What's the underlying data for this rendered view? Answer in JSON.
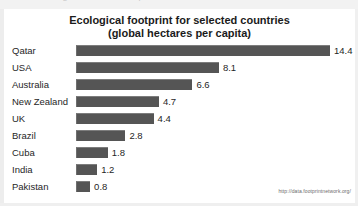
{
  "scan": {
    "top_ghost_text": "Ecological footprint"
  },
  "chart_data": {
    "type": "bar",
    "orientation": "horizontal",
    "title": "Ecological footprint for selected countries",
    "subtitle": "(global hectares per capita)",
    "xlabel": "",
    "ylabel": "",
    "xlim": [
      0,
      14.4
    ],
    "grid": false,
    "legend": false,
    "source": "http://data.footprintnetwork.org/",
    "categories": [
      "Qatar",
      "USA",
      "Australia",
      "New Zealand",
      "UK",
      "Brazil",
      "Cuba",
      "India",
      "Pakistan"
    ],
    "values": [
      14.4,
      8.1,
      6.6,
      4.7,
      4.4,
      2.8,
      1.8,
      1.2,
      0.8
    ],
    "value_labels": [
      "14.4",
      "8.1",
      "6.6",
      "4.7",
      "4.4",
      "2.8",
      "1.8",
      "1.2",
      "0.8"
    ],
    "bar_color": "#555555",
    "text_color": "#262626",
    "background_color": "#ffffff"
  }
}
